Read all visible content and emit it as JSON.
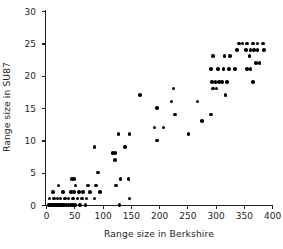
{
  "chart_data": {
    "type": "scatter",
    "title": "",
    "xlabel": "Range size in Berkshire",
    "ylabel": "Range size in SU87",
    "xlim": [
      0,
      400
    ],
    "ylim": [
      0,
      30
    ],
    "xticks": [
      0,
      50,
      100,
      150,
      200,
      250,
      300,
      350,
      400
    ],
    "yticks": [
      0,
      5,
      10,
      15,
      20,
      25,
      30
    ],
    "xtick_labels": [
      "0",
      "50",
      "100",
      "150",
      "200",
      "250",
      "300",
      "350",
      "400"
    ],
    "ytick_labels": [
      "0",
      "5",
      "10",
      "15",
      "20",
      "25",
      "30"
    ],
    "grid": false,
    "legend": null,
    "marker": "filled-circle",
    "marker_color": "#000000",
    "points": [
      [
        5,
        0
      ],
      [
        8,
        0
      ],
      [
        10,
        0
      ],
      [
        12,
        0
      ],
      [
        14,
        0
      ],
      [
        16,
        0
      ],
      [
        18,
        0
      ],
      [
        20,
        0
      ],
      [
        22,
        0
      ],
      [
        24,
        0
      ],
      [
        26,
        0
      ],
      [
        28,
        0
      ],
      [
        30,
        0
      ],
      [
        33,
        0
      ],
      [
        36,
        0
      ],
      [
        40,
        0
      ],
      [
        44,
        0
      ],
      [
        48,
        0
      ],
      [
        52,
        0
      ],
      [
        60,
        0
      ],
      [
        70,
        0
      ],
      [
        130,
        0
      ],
      [
        6,
        1
      ],
      [
        14,
        1
      ],
      [
        20,
        1
      ],
      [
        26,
        1
      ],
      [
        34,
        1
      ],
      [
        40,
        1
      ],
      [
        48,
        1
      ],
      [
        56,
        1
      ],
      [
        64,
        1
      ],
      [
        72,
        1
      ],
      [
        86,
        1
      ],
      [
        148,
        1
      ],
      [
        12,
        2
      ],
      [
        30,
        2
      ],
      [
        44,
        2
      ],
      [
        50,
        2
      ],
      [
        58,
        2
      ],
      [
        66,
        2
      ],
      [
        78,
        2
      ],
      [
        96,
        2
      ],
      [
        22,
        3
      ],
      [
        52,
        3
      ],
      [
        74,
        3
      ],
      [
        88,
        3
      ],
      [
        124,
        3
      ],
      [
        46,
        4
      ],
      [
        50,
        4
      ],
      [
        132,
        4
      ],
      [
        146,
        4
      ],
      [
        92,
        5
      ],
      [
        122,
        7
      ],
      [
        118,
        8
      ],
      [
        122,
        8
      ],
      [
        86,
        9
      ],
      [
        140,
        9
      ],
      [
        196,
        10
      ],
      [
        128,
        11
      ],
      [
        148,
        11
      ],
      [
        252,
        11
      ],
      [
        192,
        12
      ],
      [
        208,
        12
      ],
      [
        276,
        13
      ],
      [
        228,
        14
      ],
      [
        292,
        14
      ],
      [
        196,
        15
      ],
      [
        222,
        16
      ],
      [
        268,
        16
      ],
      [
        166,
        17
      ],
      [
        318,
        17
      ],
      [
        226,
        18
      ],
      [
        296,
        18
      ],
      [
        302,
        18
      ],
      [
        294,
        19
      ],
      [
        300,
        19
      ],
      [
        306,
        19
      ],
      [
        312,
        19
      ],
      [
        320,
        19
      ],
      [
        366,
        19
      ],
      [
        292,
        21
      ],
      [
        304,
        21
      ],
      [
        314,
        21
      ],
      [
        324,
        21
      ],
      [
        334,
        21
      ],
      [
        356,
        21
      ],
      [
        362,
        21
      ],
      [
        372,
        22
      ],
      [
        378,
        22
      ],
      [
        296,
        23
      ],
      [
        316,
        23
      ],
      [
        326,
        23
      ],
      [
        360,
        23
      ],
      [
        338,
        24
      ],
      [
        354,
        24
      ],
      [
        362,
        24
      ],
      [
        368,
        24
      ],
      [
        374,
        24
      ],
      [
        386,
        24
      ],
      [
        342,
        25
      ],
      [
        348,
        25
      ],
      [
        356,
        25
      ],
      [
        366,
        25
      ],
      [
        374,
        25
      ],
      [
        384,
        25
      ]
    ]
  },
  "caption_sliver": ""
}
